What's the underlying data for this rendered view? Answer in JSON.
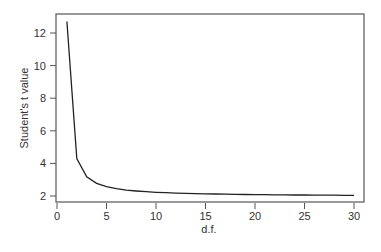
{
  "chart_data": {
    "type": "line",
    "title": "",
    "xlabel": "d.f.",
    "ylabel": "Student's t value",
    "xlim": [
      0,
      30
    ],
    "ylim": [
      2,
      12.7
    ],
    "grid": false,
    "legend": null,
    "x_ticks": [
      0,
      5,
      10,
      15,
      20,
      25,
      30
    ],
    "y_ticks": [
      2,
      4,
      6,
      8,
      10,
      12
    ],
    "x": [
      1,
      2,
      3,
      4,
      5,
      6,
      7,
      8,
      9,
      10,
      11,
      12,
      13,
      14,
      15,
      16,
      17,
      18,
      19,
      20,
      21,
      22,
      23,
      24,
      25,
      26,
      27,
      28,
      29,
      30
    ],
    "series": [
      {
        "name": "t value",
        "color": "#222222",
        "values": [
          12.706,
          4.303,
          3.182,
          2.776,
          2.571,
          2.447,
          2.365,
          2.306,
          2.262,
          2.228,
          2.201,
          2.179,
          2.16,
          2.145,
          2.131,
          2.12,
          2.11,
          2.101,
          2.093,
          2.086,
          2.08,
          2.074,
          2.069,
          2.064,
          2.06,
          2.056,
          2.052,
          2.048,
          2.045,
          2.042
        ]
      }
    ]
  },
  "axes": {
    "xlabel": "d.f.",
    "ylabel": "Student's t value"
  }
}
